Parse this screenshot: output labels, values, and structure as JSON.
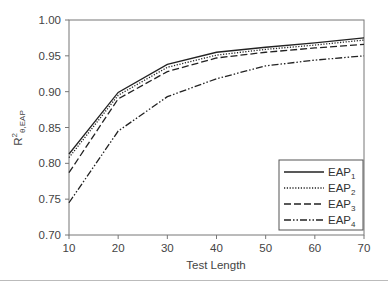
{
  "chart_data": {
    "type": "line",
    "title": "",
    "xlabel": "Test Length",
    "ylabel": "R²θ,EAP",
    "ylabel_main": "R",
    "ylabel_sup": "2",
    "ylabel_sub": "θ,EAP",
    "x": [
      10,
      20,
      30,
      40,
      50,
      60,
      70
    ],
    "xlim": [
      10,
      70
    ],
    "ylim": [
      0.7,
      1.0
    ],
    "x_ticks": [
      "10",
      "20",
      "30",
      "40",
      "50",
      "60",
      "70"
    ],
    "y_ticks": [
      "0.70",
      "0.75",
      "0.80",
      "0.85",
      "0.90",
      "0.95",
      "1.00"
    ],
    "grid": false,
    "legend_position": "lower right",
    "series": [
      {
        "name": "EAP1",
        "label_main": "EAP",
        "label_sub": "1",
        "style": "solid",
        "values": [
          0.813,
          0.899,
          0.938,
          0.955,
          0.962,
          0.968,
          0.975
        ]
      },
      {
        "name": "EAP2",
        "label_main": "EAP",
        "label_sub": "2",
        "style": "dotted",
        "values": [
          0.808,
          0.895,
          0.934,
          0.951,
          0.959,
          0.965,
          0.972
        ]
      },
      {
        "name": "EAP3",
        "label_main": "EAP",
        "label_sub": "3",
        "style": "dashed",
        "values": [
          0.787,
          0.89,
          0.928,
          0.947,
          0.955,
          0.961,
          0.966
        ]
      },
      {
        "name": "EAP4",
        "label_main": "EAP",
        "label_sub": "4",
        "style": "dash-dot-dot",
        "values": [
          0.745,
          0.845,
          0.893,
          0.918,
          0.936,
          0.944,
          0.95
        ]
      }
    ]
  }
}
